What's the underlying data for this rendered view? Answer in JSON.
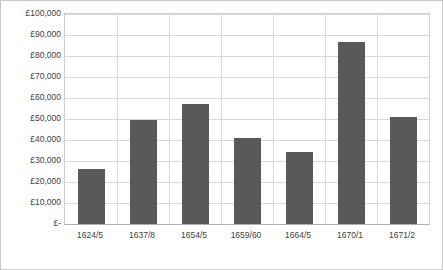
{
  "chart_data": {
    "type": "bar",
    "title": "",
    "subtitle": "",
    "xlabel": "",
    "ylabel": "",
    "categories": [
      "1624/5",
      "1637/8",
      "1654/5",
      "1659/60",
      "1664/5",
      "1670/1",
      "1671/2"
    ],
    "values": [
      26000,
      49500,
      57000,
      41000,
      34500,
      86500,
      51000
    ],
    "ylim": [
      0,
      100000
    ],
    "ytick_labels": [
      "£-",
      "£10,000",
      "£20,000",
      "£30,000",
      "£40,000",
      "£50,000",
      "£60,000",
      "£70,000",
      "£80,000",
      "£90,000",
      "£100,000"
    ],
    "ytick_values": [
      0,
      10000,
      20000,
      30000,
      40000,
      50000,
      60000,
      70000,
      80000,
      90000,
      100000
    ],
    "grid": true,
    "legend": false,
    "legend_position": "none",
    "bar_color": "#595959",
    "grid_color": "#d9d9d9",
    "plot_border_color": "#d0d0d0",
    "text_color": "#404040"
  }
}
